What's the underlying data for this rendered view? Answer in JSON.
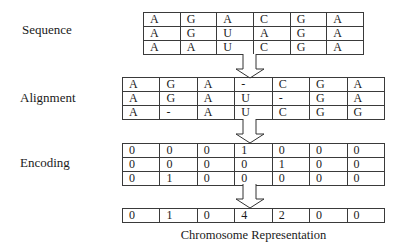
{
  "labels": {
    "sequence": "Sequence",
    "alignment": "Alignment",
    "encoding": "Encoding",
    "caption": "Chromosome Representation"
  },
  "sequence_table": [
    [
      "A",
      "G",
      "A",
      "C",
      "G",
      "A"
    ],
    [
      "A",
      "G",
      "U",
      "A",
      "G",
      "A"
    ],
    [
      "A",
      "A",
      "U",
      "C",
      "G",
      "A"
    ]
  ],
  "alignment_table": [
    [
      "A",
      "G",
      "A",
      "-",
      "C",
      "G",
      "A"
    ],
    [
      "A",
      "G",
      "A",
      "U",
      "-",
      "G",
      "A"
    ],
    [
      "A",
      "-",
      "A",
      "U",
      "C",
      "G",
      "G"
    ]
  ],
  "encoding_table": [
    [
      "0",
      "0",
      "0",
      "1",
      "0",
      "0",
      "0"
    ],
    [
      "0",
      "0",
      "0",
      "0",
      "1",
      "0",
      "0"
    ],
    [
      "0",
      "1",
      "0",
      "0",
      "0",
      "0",
      "0"
    ]
  ],
  "chromosome_row": [
    "0",
    "1",
    "0",
    "4",
    "2",
    "0",
    "0"
  ],
  "icons": {
    "arrow": "down-arrow-icon"
  }
}
